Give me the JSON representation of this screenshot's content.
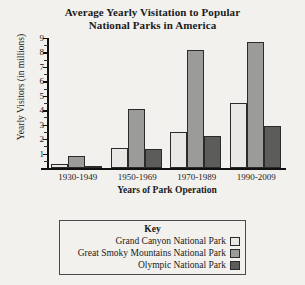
{
  "chart_data": {
    "type": "bar",
    "title": "Average Yearly Visitation to Popular National Parks in America",
    "title_line1": "Average Yearly Visitation to Popular",
    "title_line2": "National Parks in America",
    "xlabel": "Years of Park Operation",
    "ylabel": "Yearly Visitors (in millions)",
    "ylim": [
      0,
      9
    ],
    "ytick_labels": [
      "1",
      "2",
      "3",
      "4",
      "5",
      "6",
      "7",
      "8",
      "9"
    ],
    "ytick_values": [
      1,
      2,
      3,
      4,
      5,
      6,
      7,
      8,
      9
    ],
    "minor_tick_step": 0.5,
    "grid": false,
    "legend_position": "below-center",
    "legend_title": "Key",
    "categories": [
      "1930-1949",
      "1950-1969",
      "1970-1989",
      "1990-2009"
    ],
    "series": [
      {
        "name": "Grand Canyon National Park",
        "color": "#e9e8e5",
        "values": [
          0.3,
          1.4,
          2.5,
          4.5
        ]
      },
      {
        "name": "Great Smoky Mountains National Park",
        "color": "#9b9b99",
        "values": [
          0.8,
          4.1,
          8.2,
          8.7
        ]
      },
      {
        "name": "Olympic National Park",
        "color": "#5c5c5a",
        "values": [
          0.15,
          1.3,
          2.2,
          2.9
        ]
      }
    ]
  },
  "colors": {
    "background": "#f2f1ee",
    "axis": "#111111",
    "bar_outline": "#2b2b2b",
    "legend_border": "#4a4a4a"
  }
}
